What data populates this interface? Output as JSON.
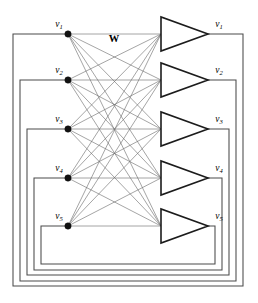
{
  "figure": {
    "weight_label": "W",
    "input_nodes": [
      {
        "id": "v1",
        "var": "v",
        "sub": "1",
        "label": "v1",
        "x": 68,
        "y": 34
      },
      {
        "id": "v2",
        "var": "v",
        "sub": "2",
        "label": "v2",
        "x": 68,
        "y": 80
      },
      {
        "id": "v3",
        "var": "v",
        "sub": "3",
        "label": "v3",
        "x": 68,
        "y": 129
      },
      {
        "id": "v4",
        "var": "v",
        "sub": "4",
        "label": "v4",
        "x": 68,
        "y": 178
      },
      {
        "id": "v5",
        "var": "v",
        "sub": "5",
        "label": "v5",
        "x": 68,
        "y": 226
      }
    ],
    "amplifiers": [
      {
        "id": "amp1",
        "var": "v",
        "sub": "1",
        "label": "v1",
        "left": 161,
        "apex_x": 208,
        "apex_y": 34,
        "top": 17,
        "bottom": 51
      },
      {
        "id": "amp2",
        "var": "v",
        "sub": "2",
        "label": "v2",
        "left": 161,
        "apex_x": 208,
        "apex_y": 80,
        "top": 63,
        "bottom": 97
      },
      {
        "id": "amp3",
        "var": "v",
        "sub": "3",
        "label": "v3",
        "left": 161,
        "apex_x": 208,
        "apex_y": 129,
        "top": 112,
        "bottom": 146
      },
      {
        "id": "amp4",
        "var": "v",
        "sub": "4",
        "label": "v4",
        "left": 161,
        "apex_x": 208,
        "apex_y": 178,
        "top": 161,
        "bottom": 195
      },
      {
        "id": "amp5",
        "var": "v",
        "sub": "5",
        "label": "v5",
        "left": 161,
        "apex_x": 208,
        "apex_y": 226,
        "top": 209,
        "bottom": 243
      }
    ],
    "feedback_loops": [
      {
        "id": "fb1",
        "from": "amp1",
        "to": "v1",
        "right_x": 243,
        "bottom_y": 286,
        "left_x": 13
      },
      {
        "id": "fb2",
        "from": "amp2",
        "to": "v2",
        "right_x": 236,
        "bottom_y": 281,
        "left_x": 20
      },
      {
        "id": "fb3",
        "from": "amp3",
        "to": "v3",
        "right_x": 229,
        "bottom_y": 275,
        "left_x": 27
      },
      {
        "id": "fb4",
        "from": "amp4",
        "to": "v4",
        "right_x": 222,
        "bottom_y": 270,
        "left_x": 34
      },
      {
        "id": "fb5",
        "from": "amp5",
        "to": "v5",
        "right_x": 215,
        "bottom_y": 264,
        "left_x": 41
      }
    ],
    "weight_matrix": {
      "label": "W",
      "x": 114,
      "y": 42,
      "description": "full 5x5 synaptic weight matrix connecting every input node to every amplifier input",
      "connection_count": 25
    },
    "geometry": {
      "node_dot_radius": 3.2,
      "amp_input_x": 161,
      "amp_apex_x": 208,
      "canvas_width": 258,
      "canvas_height": 303
    },
    "colors": {
      "background": "#ffffff",
      "node_fill": "#111111",
      "amplifier_stroke": "#1c1c1c",
      "weight_line": "#6d6d6d",
      "feedback_line": "#4a4a4a",
      "label_text": "#000000"
    }
  }
}
